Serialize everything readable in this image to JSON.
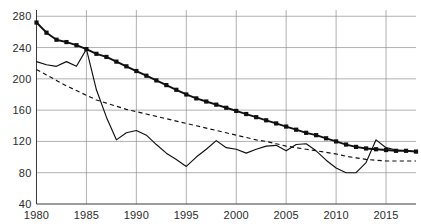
{
  "chart_data": {
    "type": "line",
    "title": "",
    "xlabel": "",
    "ylabel": "",
    "xlim": [
      1980,
      2018
    ],
    "ylim": [
      40,
      288
    ],
    "grid": true,
    "legend_position": "none",
    "y_ticks": [
      40,
      80,
      120,
      160,
      200,
      240,
      280
    ],
    "x_ticks": [
      1980,
      1985,
      1990,
      1995,
      2000,
      2005,
      2010,
      2015
    ],
    "x": [
      1980,
      1981,
      1982,
      1983,
      1984,
      1985,
      1986,
      1987,
      1988,
      1989,
      1990,
      1991,
      1992,
      1993,
      1994,
      1995,
      1996,
      1997,
      1998,
      1999,
      2000,
      2001,
      2002,
      2003,
      2004,
      2005,
      2006,
      2007,
      2008,
      2009,
      2010,
      2011,
      2012,
      2013,
      2014,
      2015,
      2016,
      2017,
      2018
    ],
    "series": [
      {
        "name": "series-markers",
        "style": "solid-thick-square-markers",
        "markers": true,
        "values": [
          272,
          259,
          250,
          247,
          243,
          238,
          232,
          228,
          222,
          216,
          210,
          204,
          198,
          192,
          186,
          180,
          175,
          171,
          167,
          163,
          159,
          155,
          151,
          147,
          143,
          139,
          135,
          131,
          128,
          124,
          120,
          116,
          113,
          111,
          110,
          109,
          108,
          108,
          107
        ]
      },
      {
        "name": "series-thin-solid",
        "style": "solid-thin",
        "markers": false,
        "values": [
          222,
          218,
          216,
          222,
          216,
          238,
          186,
          151,
          122,
          131,
          134,
          128,
          116,
          105,
          97,
          88,
          100,
          110,
          121,
          112,
          110,
          105,
          110,
          114,
          115,
          108,
          116,
          117,
          108,
          96,
          86,
          80,
          80,
          93,
          122,
          112,
          109,
          108,
          107
        ]
      },
      {
        "name": "series-dashed",
        "style": "dashed-thin",
        "markers": false,
        "values": [
          212,
          205,
          198,
          191,
          185,
          179,
          173,
          169,
          165,
          161,
          158,
          155,
          152,
          149,
          146,
          143,
          140,
          137,
          134,
          131,
          128,
          125,
          122,
          120,
          117,
          114,
          112,
          110,
          108,
          106,
          104,
          101,
          99,
          97,
          96,
          95,
          95,
          95,
          95
        ]
      }
    ]
  }
}
